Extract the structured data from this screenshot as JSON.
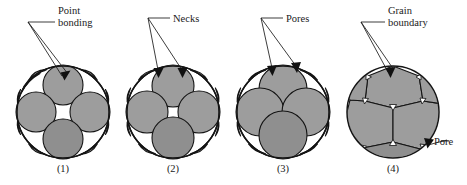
{
  "figure": {
    "title_visible": false,
    "background_color": "#ffffff",
    "grain_fill_color": "#9d9d9d",
    "grain_fill_color_dark": "#8f8f8f",
    "outline_color": "#141414",
    "text_color": "#1a1a1a",
    "pore_color": "#ffffff"
  },
  "callouts": [
    {
      "id": "point-bonding",
      "line1": "Point",
      "line2": "bonding",
      "arrows": 1
    },
    {
      "id": "necks",
      "line1": "Necks",
      "line2": "",
      "arrows": 2
    },
    {
      "id": "pores",
      "line1": "Pores",
      "line2": "",
      "arrows": 2
    },
    {
      "id": "grain-boundary",
      "line1": "Grain",
      "line2": "boundary",
      "arrows": 1
    },
    {
      "id": "pore",
      "line1": "Pore",
      "line2": "",
      "arrows": 1
    }
  ],
  "panels": [
    {
      "id": "panel-1",
      "caption": "(1)",
      "stage": "point bonding",
      "description": "Discrete spherical particles touching at points inside an outer circle, large white triangular pores between them"
    },
    {
      "id": "panel-2",
      "caption": "(2)",
      "stage": "neck formation",
      "description": "Particles joined by necks, pores still large and triangular"
    },
    {
      "id": "panel-3",
      "caption": "(3)",
      "stage": "pore shrinkage",
      "description": "Particles coalescing further, pores reduced to small triangles"
    },
    {
      "id": "panel-4",
      "caption": "(4)",
      "stage": "grain boundary formation",
      "description": "Polygonal grains separated by straight grain boundaries with tiny residual pores at triple junctions"
    }
  ]
}
